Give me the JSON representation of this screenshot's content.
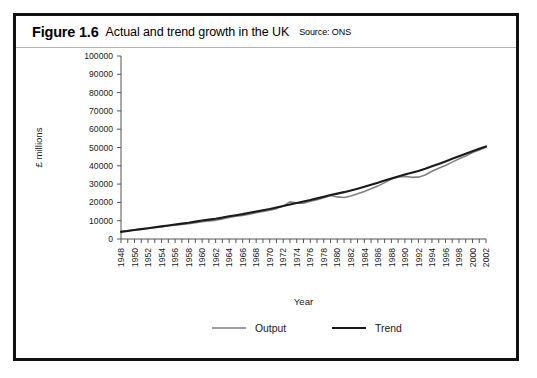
{
  "figure": {
    "number": "Figure 1.6",
    "title": "Actual and trend growth in the UK",
    "source": "Source: ONS"
  },
  "chart_data": {
    "type": "line",
    "title": "Actual and trend growth in the UK",
    "xlabel": "Year",
    "ylabel": "£ millions",
    "xlim": [
      1948,
      2002
    ],
    "ylim": [
      0,
      100000
    ],
    "ytick_step": 10000,
    "yticks": [
      0,
      10000,
      20000,
      30000,
      40000,
      50000,
      60000,
      70000,
      80000,
      90000,
      100000
    ],
    "xtick_step": 1,
    "xtick_label_step": 2,
    "xticklabels": [
      "1948",
      "1950",
      "1952",
      "1954",
      "1956",
      "1958",
      "1960",
      "1962",
      "1964",
      "1966",
      "1968",
      "1970",
      "1972",
      "1974",
      "1976",
      "1978",
      "1980",
      "1982",
      "1984",
      "1986",
      "1988",
      "1990",
      "1992",
      "1994",
      "1996",
      "1998",
      "2000",
      "2002"
    ],
    "grid": false,
    "legend_position": "bottom",
    "colors": {
      "output": "#808080",
      "trend": "#1a1a1a",
      "axis": "#555555"
    },
    "x": [
      1948,
      1949,
      1950,
      1951,
      1952,
      1953,
      1954,
      1955,
      1956,
      1957,
      1958,
      1959,
      1960,
      1961,
      1962,
      1963,
      1964,
      1965,
      1966,
      1967,
      1968,
      1969,
      1970,
      1971,
      1972,
      1973,
      1974,
      1975,
      1976,
      1977,
      1978,
      1979,
      1980,
      1981,
      1982,
      1983,
      1984,
      1985,
      1986,
      1987,
      1988,
      1989,
      1990,
      1991,
      1992,
      1993,
      1994,
      1995,
      1996,
      1997,
      1998,
      1999,
      2000,
      2001,
      2002
    ],
    "series": [
      {
        "name": "Output",
        "color": "#808080",
        "width": 1.6,
        "values": [
          4200,
          4500,
          4900,
          5200,
          5400,
          5800,
          6200,
          6600,
          6900,
          7200,
          7400,
          7900,
          8400,
          8700,
          8900,
          9400,
          10100,
          10500,
          10800,
          11200,
          11900,
          12300,
          12700,
          13300,
          14200,
          15700,
          15100,
          15000,
          15700,
          16100,
          16800,
          17600,
          17000,
          16700,
          17100,
          17800,
          18600,
          19400,
          20300,
          21400,
          22600,
          23200,
          23300,
          22900,
          22800,
          23400,
          24500,
          25400,
          26200,
          27100,
          28000,
          28800,
          29700,
          30400,
          31100
        ],
        "values_scaled": [
          4200,
          4600,
          5000,
          5400,
          5700,
          6200,
          6700,
          7200,
          7600,
          8000,
          8300,
          8900,
          9500,
          9900,
          10200,
          10900,
          11800,
          12400,
          12900,
          13500,
          14400,
          15000,
          15700,
          16600,
          18000,
          20300,
          19600,
          19500,
          20600,
          21400,
          22500,
          23800,
          23000,
          22700,
          23500,
          24700,
          26000,
          27400,
          28900,
          30800,
          32800,
          33900,
          34200,
          33700,
          33800,
          35000,
          37000,
          38700,
          40200,
          42000,
          43800,
          45400,
          47200,
          48600,
          50100
        ]
      },
      {
        "name": "Trend",
        "color": "#1a1a1a",
        "width": 2.1,
        "values_scaled": [
          3900,
          4400,
          4900,
          5400,
          5900,
          6400,
          6900,
          7400,
          7900,
          8400,
          8900,
          9500,
          10100,
          10600,
          11100,
          11700,
          12400,
          13000,
          13600,
          14300,
          15000,
          15700,
          16400,
          17200,
          18000,
          18900,
          19700,
          20500,
          21300,
          22200,
          23100,
          24000,
          24800,
          25600,
          26500,
          27500,
          28500,
          29600,
          30700,
          31900,
          33100,
          34200,
          35200,
          36200,
          37200,
          38400,
          39700,
          41000,
          42400,
          43800,
          45200,
          46600,
          48000,
          49300,
          50600
        ]
      }
    ],
    "y_plot_max": 100000,
    "note": "values_scaled are the plotted £ millions levels read off the vertical axis; the Output series shows cyclical deviation around the smooth Trend (1973 boom peak, 1980-81 and 1991-92 recessions)."
  },
  "legend": {
    "items": [
      {
        "label": "Output",
        "color": "#808080"
      },
      {
        "label": "Trend",
        "color": "#1a1a1a"
      }
    ]
  }
}
